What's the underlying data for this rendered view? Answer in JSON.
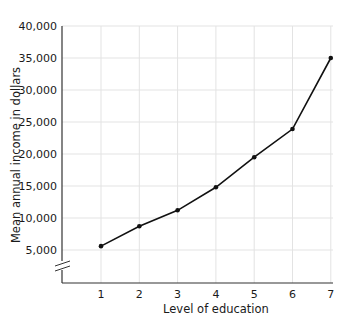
{
  "chart_data": {
    "type": "line",
    "title": "",
    "xlabel": "Level of education",
    "ylabel": "Mean annual income in dollars",
    "categories": [
      "1",
      "2",
      "3",
      "4",
      "5",
      "6",
      "7"
    ],
    "x": [
      1,
      2,
      3,
      4,
      5,
      6,
      7
    ],
    "series": [
      {
        "name": "Mean annual income",
        "values": [
          5600,
          8700,
          11200,
          14800,
          19500,
          23900,
          35000
        ]
      }
    ],
    "yticks": [
      5000,
      10000,
      15000,
      20000,
      25000,
      30000,
      35000,
      40000
    ],
    "ytick_labels": [
      "5,000",
      "10,000",
      "15,000",
      "20,000",
      "25,000",
      "30,000",
      "35,000",
      "40,000"
    ],
    "ylim": [
      0,
      40000
    ],
    "xlim": [
      0,
      7
    ],
    "axis_break": "y-axis break below 5,000",
    "grid": true,
    "legend": "none",
    "colors": {
      "line": "#111111",
      "grid": "#e3e3e3",
      "axis": "#333333"
    }
  }
}
